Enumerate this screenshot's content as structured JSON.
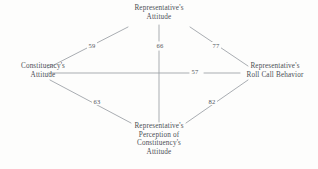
{
  "figure": {
    "kind": "path-diagram",
    "background_color": "#fdfdfc",
    "line_color": "#9a9ea4",
    "text_color": "#4b4f55"
  },
  "nodes": [
    {
      "id": "representatives-attitude",
      "lines": [
        "Representative's",
        "Attitude"
      ],
      "position": "top"
    },
    {
      "id": "constituencys-attitude",
      "lines": [
        "Constituency's",
        "Attitude"
      ],
      "position": "left"
    },
    {
      "id": "representatives-roll-call-behavior",
      "lines": [
        "Representative's",
        "Roll Call Behavior"
      ],
      "position": "right"
    },
    {
      "id": "representatives-perception-of-constituencys-attitude",
      "lines": [
        "Representative's",
        "Perception of",
        "Constituency's",
        "Attitude"
      ],
      "position": "bottom"
    }
  ],
  "edges": [
    {
      "id": "const-attitude-to-rep-attitude",
      "from": "constituencys-attitude",
      "to": "representatives-attitude",
      "value": "59"
    },
    {
      "id": "rep-attitude-to-rep-perception",
      "from": "representatives-attitude",
      "to": "representatives-perception-of-constituencys-attitude",
      "value": "66"
    },
    {
      "id": "rep-attitude-to-roll-call",
      "from": "representatives-attitude",
      "to": "representatives-roll-call-behavior",
      "value": "77"
    },
    {
      "id": "const-attitude-to-roll-call",
      "from": "constituencys-attitude",
      "to": "representatives-roll-call-behavior",
      "value": "57"
    },
    {
      "id": "const-attitude-to-rep-perception",
      "from": "constituencys-attitude",
      "to": "representatives-perception-of-constituencys-attitude",
      "value": "63"
    },
    {
      "id": "rep-perception-to-roll-call",
      "from": "representatives-perception-of-constituencys-attitude",
      "to": "representatives-roll-call-behavior",
      "value": "82"
    }
  ]
}
